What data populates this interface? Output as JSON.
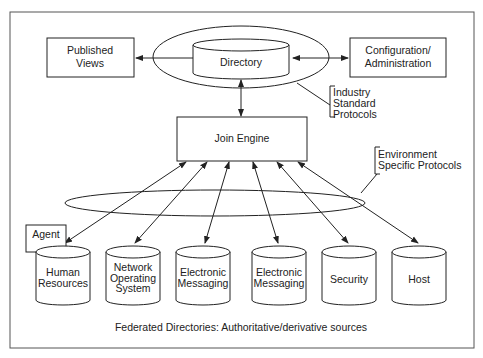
{
  "diagram": {
    "caption": "Federated Directories: Authoritative/derivative sources",
    "nodes": {
      "published_views": [
        "Published",
        "Views"
      ],
      "directory": "Directory",
      "configuration": [
        "Configuration/",
        "Administration"
      ],
      "join_engine": "Join Engine",
      "agent": "Agent"
    },
    "annotations": {
      "industry": [
        "Industry",
        "Standard",
        "Protocols"
      ],
      "environment": [
        "Environment",
        "Specific Protocols"
      ]
    },
    "sources": [
      {
        "lines": [
          "Human",
          "Resources"
        ]
      },
      {
        "lines": [
          "Network",
          "Operating",
          "System"
        ]
      },
      {
        "lines": [
          "Electronic",
          "Messaging"
        ]
      },
      {
        "lines": [
          "Electronic",
          "Messaging"
        ]
      },
      {
        "lines": [
          "Security"
        ]
      },
      {
        "lines": [
          "Host"
        ]
      }
    ]
  }
}
